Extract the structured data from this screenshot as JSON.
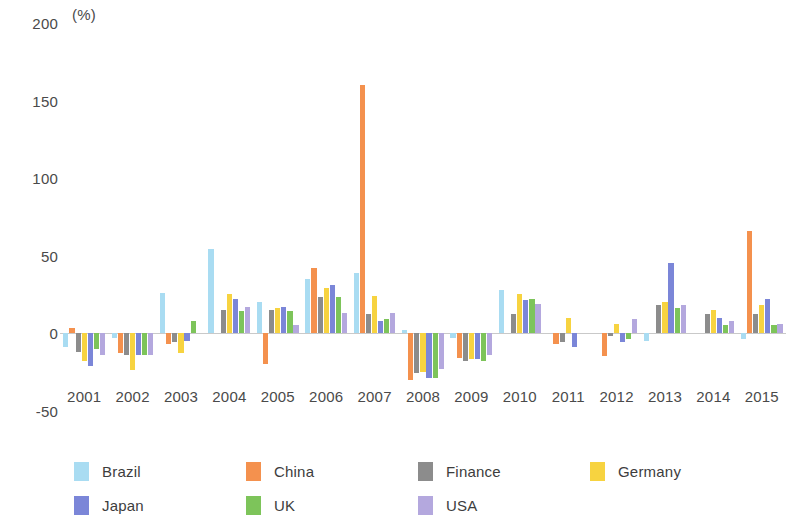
{
  "chart_data": {
    "type": "bar",
    "title": "",
    "subtitle": "",
    "xlabel": "",
    "ylabel": "",
    "unit_label": "(%)",
    "ylim": [
      -50,
      200
    ],
    "yticks": [
      200,
      150,
      100,
      50,
      0,
      -50
    ],
    "ytick_labels": [
      "200",
      "150",
      "100",
      "50",
      "0",
      "-50"
    ],
    "grid": false,
    "legend_position": "bottom",
    "categories": [
      "2001",
      "2002",
      "2003",
      "2004",
      "2005",
      "2006",
      "2007",
      "2008",
      "2009",
      "2010",
      "2011",
      "2012",
      "2013",
      "2014",
      "2015"
    ],
    "series": [
      {
        "name": "Brazil",
        "color": "#a9dcf2",
        "values": [
          -9,
          -3,
          26,
          54,
          20,
          35,
          39,
          2,
          -3,
          28,
          0,
          0,
          -5,
          0,
          -4
        ]
      },
      {
        "name": "China",
        "color": "#f4914e",
        "values": [
          3,
          -13,
          -7,
          0,
          -20,
          42,
          160,
          -30,
          -16,
          0,
          -7,
          -15,
          0,
          0,
          66
        ]
      },
      {
        "name": "Finance",
        "color": "#8c8c8c",
        "values": [
          -12,
          -14,
          -6,
          15,
          15,
          23,
          12,
          -26,
          -18,
          12,
          -6,
          -2,
          18,
          12,
          12
        ]
      },
      {
        "name": "Germany",
        "color": "#f7d340",
        "values": [
          -18,
          -24,
          -13,
          25,
          16,
          29,
          24,
          -25,
          -17,
          25,
          10,
          6,
          20,
          15,
          18
        ]
      },
      {
        "name": "Japan",
        "color": "#7b86d8",
        "values": [
          -21,
          -14,
          -5,
          22,
          17,
          31,
          8,
          -29,
          -17,
          21,
          -9,
          -6,
          45,
          10,
          22
        ]
      },
      {
        "name": "UK",
        "color": "#7dc45a",
        "values": [
          -10,
          -14,
          8,
          14,
          14,
          23,
          9,
          -29,
          -18,
          22,
          0,
          -4,
          16,
          5,
          5
        ]
      },
      {
        "name": "USA",
        "color": "#b4a8de",
        "values": [
          -14,
          -14,
          0,
          17,
          5,
          13,
          13,
          -23,
          -14,
          19,
          0,
          9,
          18,
          8,
          6
        ]
      }
    ]
  },
  "legend": {
    "items": [
      {
        "label": "Brazil"
      },
      {
        "label": "China"
      },
      {
        "label": "Finance"
      },
      {
        "label": "Germany"
      },
      {
        "label": "Japan"
      },
      {
        "label": "UK"
      },
      {
        "label": "USA"
      }
    ]
  }
}
